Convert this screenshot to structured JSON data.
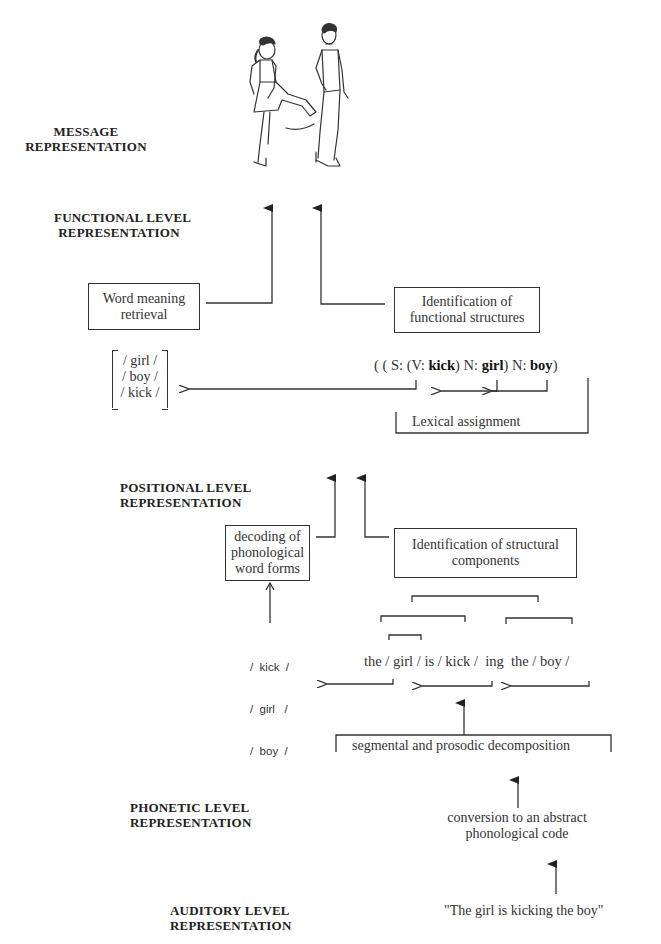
{
  "levels": {
    "message": [
      "MESSAGE",
      "REPRESENTATION"
    ],
    "functional": [
      "FUNCTIONAL LEVEL",
      "REPRESENTATION"
    ],
    "positional": [
      "POSITIONAL LEVEL",
      "REPRESENTATION"
    ],
    "phonetic": [
      "PHONETIC LEVEL",
      "REPRESENTATION"
    ],
    "auditory": [
      "AUDITORY LEVEL",
      "REPRESENTATION"
    ]
  },
  "illustration": {
    "description": "girl kicking boy line drawing"
  },
  "functional": {
    "word_meaning_box": [
      "Word meaning",
      "retrieval"
    ],
    "identification_box": [
      "Identification of",
      "functional structures"
    ],
    "lexicon": [
      "/ girl /",
      "/ boy /",
      "/ kick /"
    ],
    "structure": {
      "p1": "( ( S: (V: ",
      "kick": "kick",
      "p2": ") N: ",
      "girl": "girl",
      "p3": ") N: ",
      "boy": "boy",
      "p4": ")"
    },
    "lexical_assignment": "Lexical assignment"
  },
  "positional": {
    "decoding_box": [
      "decoding of",
      "phonological",
      "word forms"
    ],
    "identification_box": [
      "Identification of structural",
      "components"
    ],
    "word_forms": [
      "/  kick  /",
      "/  girl   /",
      "/  boy  /"
    ],
    "segmented_sentence": "the / girl / is / kick /  ing  the / boy /",
    "decomposition": "segmental and prosodic decomposition"
  },
  "phonetic": {
    "conversion": [
      "conversion to an abstract",
      "phonological code"
    ]
  },
  "auditory": {
    "input": "\"The girl is kicking the boy\""
  }
}
